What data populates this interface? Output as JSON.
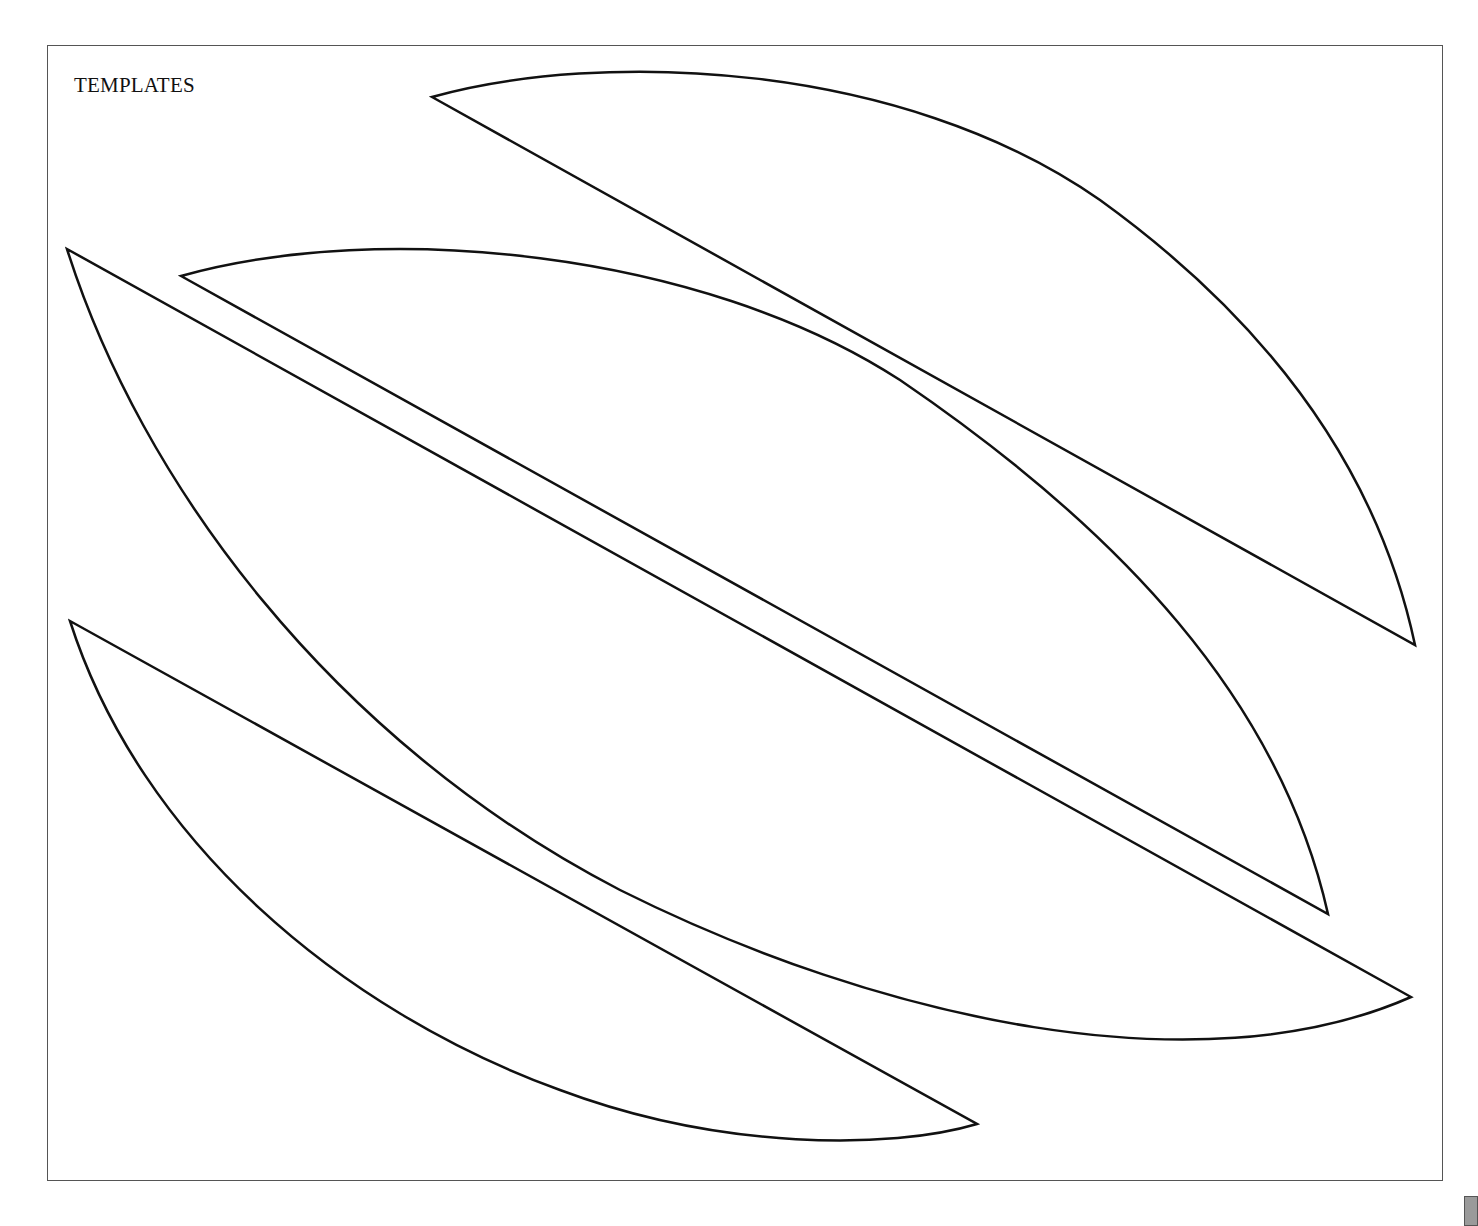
{
  "page": {
    "title": "TEMPLATES"
  },
  "templates": [
    {
      "name": "leaf-template-1",
      "description": "Top-right curved leaf/petal shape"
    },
    {
      "name": "leaf-template-2",
      "description": "Middle narrow curved leaf/petal shape"
    },
    {
      "name": "leaf-template-3",
      "description": "Large central curved leaf/petal shape"
    },
    {
      "name": "leaf-template-4",
      "description": "Bottom-left curved leaf/petal shape"
    }
  ],
  "colors": {
    "stroke": "#111111",
    "frame": "#555555",
    "background": "#ffffff"
  }
}
